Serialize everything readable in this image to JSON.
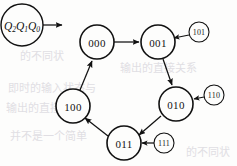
{
  "figure": {
    "type": "state-transition-diagram",
    "state_label_legend": "Q2Q1Q0",
    "legend_parts": {
      "base": "Q",
      "sub2": "2",
      "sub1": "1",
      "sub0": "0"
    }
  },
  "nodes": [
    {
      "id": "legend",
      "label": "Q2Q1Q0",
      "kind": "legend-circle",
      "cx": 22,
      "cy": 25,
      "r": 21
    },
    {
      "id": "s000",
      "label": "000",
      "kind": "state",
      "cx": 97,
      "cy": 42,
      "r": 17
    },
    {
      "id": "s001",
      "label": "001",
      "kind": "state",
      "cx": 158,
      "cy": 42,
      "r": 17
    },
    {
      "id": "s010",
      "label": "010",
      "kind": "state",
      "cx": 176,
      "cy": 104,
      "r": 17
    },
    {
      "id": "s011",
      "label": "011",
      "kind": "state",
      "cx": 124,
      "cy": 143,
      "r": 17
    },
    {
      "id": "s100",
      "label": "100",
      "kind": "state",
      "cx": 73,
      "cy": 106,
      "r": 17
    },
    {
      "id": "i101",
      "label": "101",
      "kind": "input-label",
      "cx": 199,
      "cy": 32,
      "r": 10
    },
    {
      "id": "i110",
      "label": "110",
      "kind": "input-label",
      "cx": 214,
      "cy": 95,
      "r": 10
    },
    {
      "id": "i111",
      "label": "111",
      "kind": "input-label",
      "cx": 164,
      "cy": 143,
      "r": 10
    }
  ],
  "edges": [
    {
      "from": "legend",
      "to": "",
      "kind": "pointer-arrow"
    },
    {
      "from": "s000",
      "to": "s001",
      "kind": "transition"
    },
    {
      "from": "s001",
      "to": "s010",
      "kind": "transition"
    },
    {
      "from": "s010",
      "to": "s011",
      "kind": "transition"
    },
    {
      "from": "s011",
      "to": "s100",
      "kind": "transition"
    },
    {
      "from": "s100",
      "to": "s000",
      "kind": "transition"
    },
    {
      "from": "i101",
      "to": "s001",
      "kind": "input-transition"
    },
    {
      "from": "i110",
      "to": "s010",
      "kind": "input-transition"
    },
    {
      "from": "i111",
      "to": "s011",
      "kind": "input-transition"
    }
  ],
  "colors": {
    "stroke": "#111111",
    "text": "#131313",
    "background": "#fdfdfc",
    "bleed_through": "#c9c6cf"
  },
  "bleed_through_text": [
    "的不同状",
    "即时的输入状态与",
    "输出的直接关系",
    "并不是一个简单"
  ]
}
